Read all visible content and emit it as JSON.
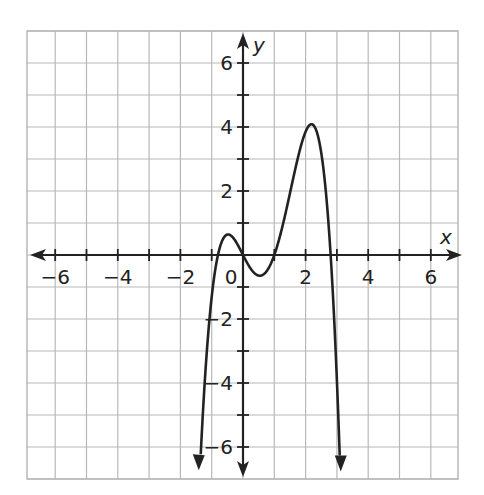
{
  "chart_data": {
    "type": "line",
    "title": "",
    "xlabel": "x",
    "ylabel": "y",
    "xlim": [
      -7,
      7
    ],
    "ylim": [
      -7,
      7
    ],
    "grid": true,
    "x_ticks": [
      -6,
      -4,
      -2,
      0,
      2,
      4,
      6
    ],
    "y_ticks": [
      -6,
      -4,
      -2,
      2,
      4,
      6
    ],
    "x_tick_labels": [
      "−6",
      "−4",
      "−2",
      "0",
      "2",
      "4",
      "6"
    ],
    "y_tick_labels": [
      "−6",
      "−4",
      "−2",
      "2",
      "4",
      "6"
    ],
    "series": [
      {
        "name": "f(x)",
        "description": "Quartic polynomial, both ends pointing down (arrows)",
        "roots": [
          -0.8,
          0,
          1,
          2.8
        ],
        "local_max": [
          [
            -0.4,
            0.6
          ],
          [
            2.2,
            4.1
          ]
        ],
        "local_min": [
          [
            0.6,
            -0.6
          ]
        ],
        "leading_coefficient": -0.86,
        "end_behavior": "down-down",
        "color": "#222222"
      }
    ]
  },
  "colors": {
    "grid": "#b8b8b8",
    "axis": "#222222",
    "curve": "#222222",
    "background": "#ffffff"
  }
}
